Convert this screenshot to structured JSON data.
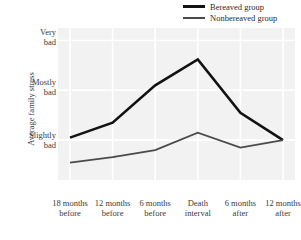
{
  "chart_data": {
    "type": "line",
    "title": "",
    "xlabel": "",
    "ylabel": "Average family stress",
    "grid": true,
    "legend_position": "top-right",
    "categories": [
      "18 months before",
      "12 months before",
      "6 months before",
      "Death interval",
      "6 months after",
      "12 months after"
    ],
    "category_lines": [
      {
        "l1": "18 months",
        "l2": "before"
      },
      {
        "l1": "12 months",
        "l2": "before"
      },
      {
        "l1": "6 months",
        "l2": "before"
      },
      {
        "l1": "Death",
        "l2": "interval"
      },
      {
        "l1": "6 months",
        "l2": "after"
      },
      {
        "l1": "12 months",
        "l2": "after"
      }
    ],
    "ytick_labels": [
      {
        "l1": "Very",
        "l2": "bad",
        "value": 3
      },
      {
        "l1": "Mostly",
        "l2": "bad",
        "value": 2
      },
      {
        "l1": "Slightly",
        "l2": "bad",
        "value": 1
      }
    ],
    "ylim": [
      0.2,
      3.25
    ],
    "series": [
      {
        "name": "Bereaved group",
        "color": "#121212",
        "width": 2.6,
        "values": [
          1.05,
          1.35,
          2.1,
          2.62,
          1.55,
          1.0
        ]
      },
      {
        "name": "Nonbereaved group",
        "color": "#4a4a4a",
        "width": 1.7,
        "values": [
          0.55,
          0.66,
          0.8,
          1.15,
          0.85,
          1.0
        ]
      }
    ]
  },
  "legend": {
    "items": [
      {
        "label": "Bereaved group"
      },
      {
        "label": "Nonbereaved group"
      }
    ]
  },
  "axes": {
    "y_title": "Average family stress"
  },
  "style": {
    "plot_background": "#f2f2f2",
    "gridline_color": "#ffffff",
    "text_color": "#3a3a3a"
  }
}
